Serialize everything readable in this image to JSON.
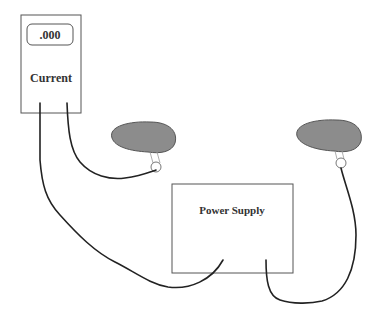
{
  "diagram": {
    "meter": {
      "display_value": ".000",
      "label": "Current"
    },
    "power_supply": {
      "label": "Power Supply"
    },
    "colors": {
      "probe_fill": "#8c8c8c",
      "outline": "#555555",
      "wire": "#222222",
      "text": "#333333"
    }
  }
}
